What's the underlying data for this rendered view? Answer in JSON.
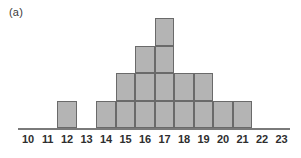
{
  "panel": {
    "label": "(a)"
  },
  "chart_data": {
    "type": "bar",
    "title": "(a)",
    "xlabel": "",
    "ylabel": "",
    "categories": [
      "10",
      "11",
      "12",
      "13",
      "14",
      "15",
      "16",
      "17",
      "18",
      "19",
      "20",
      "21",
      "22",
      "23"
    ],
    "values": [
      0,
      0,
      1,
      0,
      1,
      2,
      3,
      4,
      2,
      2,
      1,
      1,
      0,
      0
    ],
    "tick_labels": [
      "10",
      "11",
      "12",
      "13",
      "14",
      "15",
      "16",
      "17",
      "18",
      "19",
      "20",
      "21",
      "22",
      "23"
    ],
    "xlim": [
      9.5,
      23.5
    ],
    "ylim": [
      0,
      4
    ],
    "grid": false,
    "legend": null,
    "style": "stacked-unit-blocks",
    "bar_fill_color": "#b4b4b4",
    "bar_edge_color": "#6a6a6a",
    "axis_color": "#7a7a7a",
    "text_color": "#2e2e2e"
  }
}
